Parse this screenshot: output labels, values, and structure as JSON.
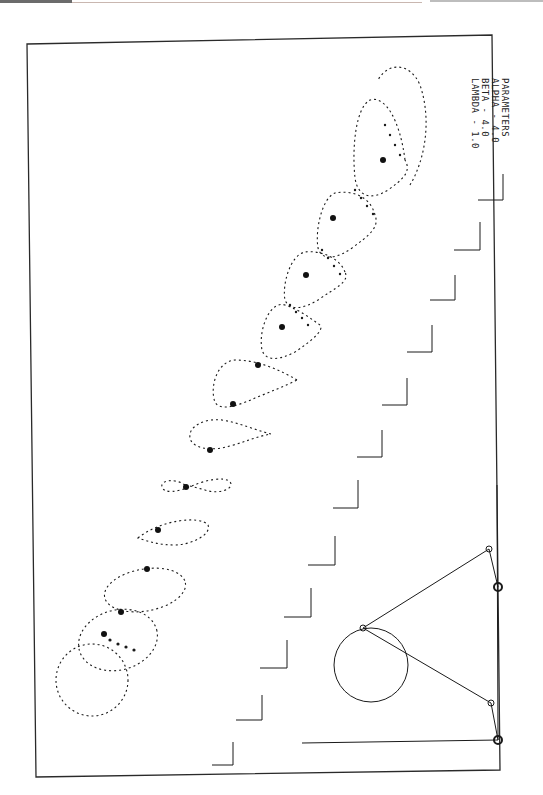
{
  "figure": {
    "type": "kinematic-trajectory-plot",
    "orientation": "rotated 90 degrees",
    "parameters_title": "PARAMETERS",
    "parameters": [
      {
        "name": "ALPHA",
        "sep": " - ",
        "value": "4.0"
      },
      {
        "name": "BETA",
        "sep": " - ",
        "value": "4.0"
      },
      {
        "name": "LAMBDA",
        "sep": " - ",
        "value": "1.0"
      }
    ],
    "curve_sequence_count": 11,
    "curve_shapes": [
      "circle",
      "ellipse-overlap",
      "ellipse",
      "teardrop",
      "figure-eight",
      "teardrop",
      "teardrop-cusp",
      "loop-cusp",
      "loop",
      "loop",
      "loop-large"
    ],
    "step_markers_count": 12,
    "linkage": {
      "description": "four-bar linkage with crank circle",
      "pivots": 2,
      "joints": 3
    }
  },
  "colors": {
    "ink": "#1a1a1a",
    "paper": "#ffffff",
    "frame": "#2a2a2a"
  }
}
